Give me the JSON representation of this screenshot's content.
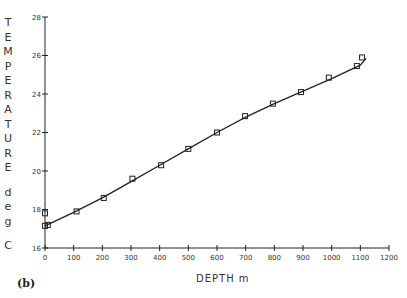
{
  "chart_data": {
    "type": "scatter",
    "title": "",
    "panel_label": "(b)",
    "xlabel": "DEPTH m",
    "ylabel": "TEMPERATURE deg C",
    "xlim": [
      0,
      1200
    ],
    "ylim": [
      16,
      28
    ],
    "x_ticks": [
      0,
      100,
      200,
      300,
      400,
      500,
      600,
      700,
      800,
      900,
      1000,
      1100,
      1200
    ],
    "y_ticks": [
      16,
      18,
      20,
      22,
      24,
      26,
      28
    ],
    "grid": false,
    "legend": null,
    "series": [
      {
        "name": "measured",
        "marker": "open-square",
        "x": [
          0,
          0,
          10,
          110,
          205,
          305,
          405,
          500,
          600,
          698,
          795,
          893,
          990,
          1088,
          1106
        ],
        "y": [
          17.8,
          17.15,
          17.2,
          17.9,
          18.6,
          19.6,
          20.3,
          21.15,
          22.0,
          22.85,
          23.5,
          24.1,
          24.85,
          25.45,
          25.9
        ]
      },
      {
        "name": "fit",
        "style": "line",
        "x": [
          0,
          100,
          200,
          300,
          400,
          500,
          600,
          700,
          800,
          900,
          1000,
          1100,
          1120
        ],
        "y": [
          17.15,
          17.85,
          18.6,
          19.45,
          20.3,
          21.15,
          22.0,
          22.8,
          23.5,
          24.15,
          24.8,
          25.5,
          25.85
        ]
      }
    ]
  }
}
